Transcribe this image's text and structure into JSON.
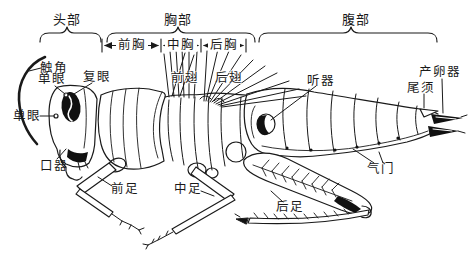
{
  "figure": {
    "kind": "labeled anatomy diagram",
    "language": "Chinese",
    "colors": {
      "background": "#ffffff",
      "ink": "#1a1a1a"
    }
  },
  "regions": {
    "head": {
      "label": "头部"
    },
    "thorax": {
      "label": "胸部"
    },
    "abdomen": {
      "label": "腹部"
    }
  },
  "thorax_segments": {
    "prothorax": "前胸",
    "mesothorax": "中胸",
    "metathorax": "后胸"
  },
  "parts": {
    "antenna": "触角",
    "ocellus_upper": "单眼",
    "compound_eye": "复眼",
    "ocellus_lower": "单眼",
    "mouthparts": "口器",
    "foreleg": "前足",
    "midleg": "中足",
    "forewing": "前翅",
    "hindwing": "后翅",
    "tympanum": "听器",
    "cercus": "尾须",
    "ovipositor": "产卵器",
    "spiracle": "气门",
    "hindleg": "后足"
  }
}
